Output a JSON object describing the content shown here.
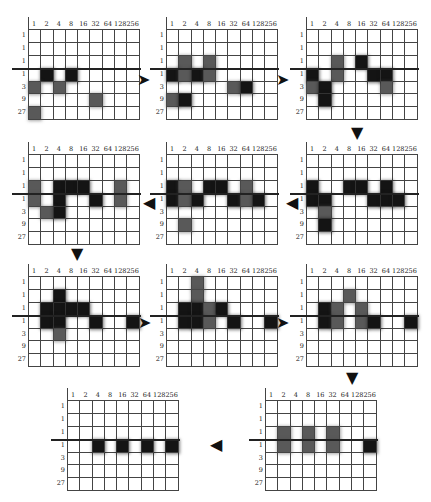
{
  "column_labels": [
    "1",
    "2",
    "4",
    "8",
    "16",
    "32",
    "64",
    "128",
    "256"
  ],
  "row_labels": [
    "1",
    "1",
    "1",
    "1",
    "3",
    "9",
    "27"
  ],
  "colors": {
    "black": "#141414",
    "gray": "#595959",
    "line": "#444444"
  },
  "legend": {
    "b": "black cell",
    "g": "gray cell",
    "empty": "."
  },
  "panels": [
    {
      "id": 1,
      "x": 28,
      "y": 29,
      "rows": [
        ".........",
        ".........",
        ".........",
        ".b.b.....",
        "g.g......",
        ".....g...",
        "g........"
      ]
    },
    {
      "id": 2,
      "x": 166,
      "y": 29,
      "rows": [
        ".........",
        ".........",
        ".g.g.....",
        "bgbg.....",
        ".....gb..",
        "gb.......",
        "........."
      ]
    },
    {
      "id": 3,
      "x": 306,
      "y": 29,
      "rows": [
        ".........",
        ".........",
        "..g.b....",
        "b.g..bb..",
        "gb....g..",
        ".b.......",
        "........."
      ]
    },
    {
      "id": 4,
      "x": 28,
      "y": 154,
      "rows": [
        ".........",
        ".........",
        "g.bbb..g.",
        "g.b..b.g.",
        ".gb......",
        ".........",
        "........."
      ]
    },
    {
      "id": 5,
      "x": 166,
      "y": 154,
      "rows": [
        ".........",
        ".........",
        "bg.bb.g..",
        "bgb..bgb.",
        ".........",
        ".g.......",
        "........."
      ]
    },
    {
      "id": 6,
      "x": 306,
      "y": 154,
      "rows": [
        ".........",
        ".........",
        "b..bb.b..",
        "bb...bbb.",
        ".g.......",
        ".b.......",
        "........."
      ]
    },
    {
      "id": 7,
      "x": 28,
      "y": 276,
      "rows": [
        ".........",
        "..b......",
        ".bbbb....",
        ".bb..b..b",
        "..g......",
        ".........",
        "........."
      ]
    },
    {
      "id": 8,
      "x": 166,
      "y": 276,
      "rows": [
        "..g......",
        "..g......",
        ".bbgb....",
        ".bbg.b..b",
        ".........",
        ".........",
        "........."
      ]
    },
    {
      "id": 9,
      "x": 306,
      "y": 276,
      "rows": [
        ".........",
        "...g.....",
        ".bg.g....",
        ".bg.gb..b",
        ".........",
        ".........",
        "........."
      ]
    },
    {
      "id": 10,
      "x": 265,
      "y": 400,
      "rows": [
        ".........",
        ".........",
        ".g.g.g...",
        ".g.g.g..b",
        ".........",
        ".........",
        "........."
      ]
    },
    {
      "id": 11,
      "x": 67,
      "y": 400,
      "rows": [
        ".........",
        ".........",
        ".........",
        "..b.b.b.b",
        ".........",
        ".........",
        "........."
      ]
    }
  ],
  "arrows": [
    {
      "from": 1,
      "to": 2,
      "glyph": "➤",
      "x": 137,
      "y": 72
    },
    {
      "from": 2,
      "to": 3,
      "glyph": "➤",
      "x": 276,
      "y": 72
    },
    {
      "from": 3,
      "to": 6,
      "glyph": "▼",
      "x": 351,
      "y": 125
    },
    {
      "from": 6,
      "to": 5,
      "glyph": "◀",
      "x": 286,
      "y": 195
    },
    {
      "from": 5,
      "to": 4,
      "glyph": "◀",
      "x": 143,
      "y": 195
    },
    {
      "from": 4,
      "to": 7,
      "glyph": "▼",
      "x": 71,
      "y": 246
    },
    {
      "from": 7,
      "to": 8,
      "glyph": "➤",
      "x": 138,
      "y": 315
    },
    {
      "from": 8,
      "to": 9,
      "glyph": "➤",
      "x": 276,
      "y": 315
    },
    {
      "from": 9,
      "to": 10,
      "glyph": "▼",
      "x": 346,
      "y": 370
    },
    {
      "from": 10,
      "to": 11,
      "glyph": "◀",
      "x": 210,
      "y": 437
    }
  ]
}
